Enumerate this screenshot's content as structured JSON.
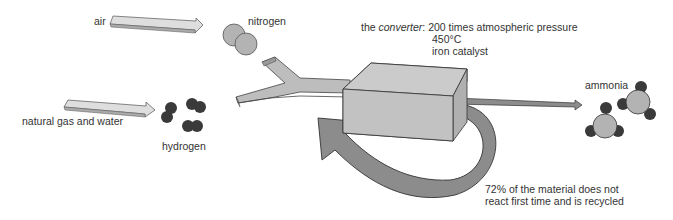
{
  "diagram": {
    "inputs": [
      {
        "label": "air",
        "product": "nitrogen"
      },
      {
        "label": "natural gas and water",
        "product": "hydrogen"
      }
    ],
    "converter": {
      "prefix": "the ",
      "name": "converter",
      "suffix": ": 200 times atmospheric pressure",
      "temperature": "450°C",
      "catalyst": "iron catalyst"
    },
    "output": {
      "label": "ammonia"
    },
    "recycle": {
      "line1": "72% of the material does not",
      "line2": "react first time and is recycled"
    },
    "colors": {
      "light_arrow": "#dcdcdc",
      "pipe": "#bdbdbd",
      "converter_box": "#c4c4c4",
      "recycle_arrow": "#8c8c8c",
      "nitrogen_atom": "#b3b3b3",
      "hydrogen_atom": "#3a3a3a",
      "outline": "#444444"
    }
  }
}
